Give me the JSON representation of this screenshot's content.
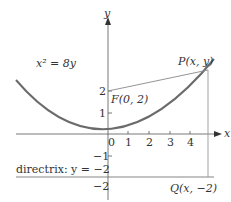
{
  "labels": {
    "y_axis": "y",
    "x_axis": "x",
    "equation": "x² = 8y",
    "point_p": "P(x, y)",
    "focus": "F(0, 2)",
    "directrix": "directrix: y = −2",
    "point_q": "Q(x, −2)",
    "origin": "0"
  },
  "ticks": {
    "x": [
      "1",
      "2",
      "3",
      "4"
    ],
    "y": [
      "2",
      "1",
      "−1",
      "−2"
    ]
  },
  "colors": {
    "curve": "#6b6b6b",
    "axis": "#555555",
    "line": "#888888",
    "text": "#333333"
  }
}
